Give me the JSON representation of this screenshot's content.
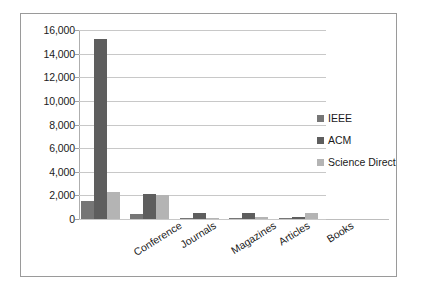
{
  "chart_data": {
    "type": "bar",
    "title": "",
    "subtitle": "",
    "xlabel": "",
    "ylabel": "",
    "categories": [
      "Conference",
      "Journals",
      "Magazines",
      "Articles",
      "Books"
    ],
    "series": [
      {
        "name": "IEEE",
        "color": "#767676",
        "values": [
          1500,
          450,
          50,
          100,
          50
        ]
      },
      {
        "name": "ACM",
        "color": "#5e5e5e",
        "values": [
          15200,
          2150,
          550,
          500,
          200
        ]
      },
      {
        "name": "Science Direct",
        "color": "#b4b4b4",
        "values": [
          2300,
          2050,
          100,
          200,
          550
        ]
      }
    ],
    "ylim": [
      0,
      16000
    ],
    "ytick_step": 2000,
    "ytick_labels": [
      "0",
      "2,000",
      "4,000",
      "6,000",
      "8,000",
      "10,000",
      "12,000",
      "14,000",
      "16,000"
    ],
    "ytick_values": [
      0,
      2000,
      4000,
      6000,
      8000,
      10000,
      12000,
      14000,
      16000
    ],
    "grid": true,
    "legend_position": "right"
  },
  "legend": {
    "items": [
      {
        "label": "IEEE"
      },
      {
        "label": "ACM"
      },
      {
        "label": "Science Direct"
      }
    ]
  }
}
